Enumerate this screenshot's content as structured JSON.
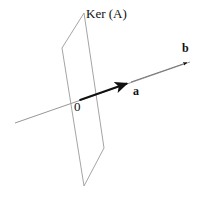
{
  "figure": {
    "title_label": "Ker (A)",
    "origin_label": "0",
    "vector_a_label": "a",
    "vector_b_label": "b",
    "background_color": "#ffffff",
    "plane_stroke_color": "#8a8a8a",
    "axis_stroke_color": "#8a8a8a",
    "vector_stroke_color": "#111111",
    "plane": {
      "shape": "parallelogram",
      "vertices": [
        {
          "x": 84,
          "y": 13
        },
        {
          "x": 104,
          "y": 148
        },
        {
          "x": 84,
          "y": 186
        },
        {
          "x": 62,
          "y": 48
        }
      ]
    },
    "axis_line": {
      "from": {
        "x": 15,
        "y": 123
      },
      "to": {
        "x": 190,
        "y": 62
      }
    },
    "vector_a": {
      "from": {
        "x": 80,
        "y": 100
      },
      "to": {
        "x": 131,
        "y": 82
      }
    },
    "vector_b": {
      "from": {
        "x": 80,
        "y": 100
      },
      "to": {
        "x": 190,
        "y": 62
      }
    }
  }
}
